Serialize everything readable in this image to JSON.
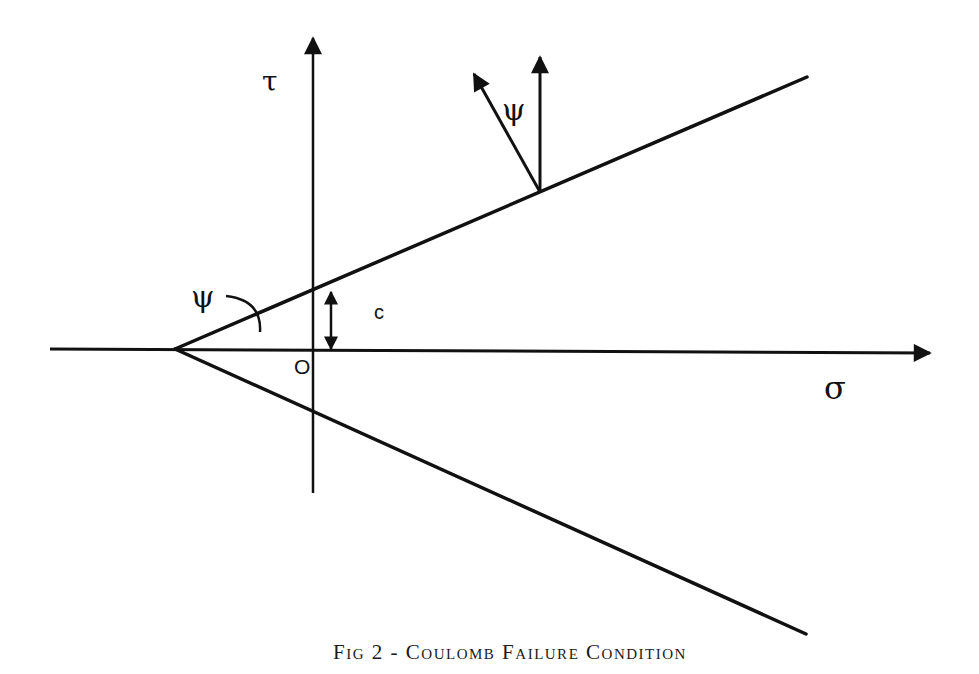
{
  "figure": {
    "caption": "Fig 2 - Coulomb Failure Condition",
    "axes": {
      "horizontal_label": "σ",
      "vertical_label": "τ",
      "origin_label": "O"
    },
    "annotations": {
      "cohesion_label": "c",
      "apex_angle_label": "ψ",
      "flow_angle_label": "ψ"
    },
    "colors": {
      "line": "#111111",
      "background": "#ffffff"
    }
  }
}
